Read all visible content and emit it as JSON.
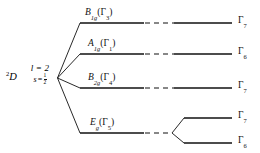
{
  "figure": {
    "type": "energy-level-splitting-diagram",
    "background_color": "#ffffff",
    "line_color": "#111111",
    "width": 260,
    "height": 153
  },
  "term_symbol": {
    "multiplicity": "2",
    "term": "D",
    "quantum_numbers": {
      "orbital_text": "l = 2",
      "spin_symbol": "s",
      "spin_equals": "=",
      "spin_numerator": "1",
      "spin_denominator": "2"
    }
  },
  "levels": [
    {
      "id": "level-b1g",
      "label_main": "B",
      "label_sub": "1g",
      "label_paren_open": "(",
      "label_gamma": "Γ",
      "label_gamma_sub": "3",
      "label_paren_close": ")",
      "right_gamma": "Γ",
      "right_gamma_sub": "7",
      "y": 23
    },
    {
      "id": "level-a1g",
      "label_main": "A",
      "label_sub": "1g",
      "label_paren_open": "(",
      "label_gamma": "Γ",
      "label_gamma_sub": "1",
      "label_paren_close": ")",
      "right_gamma": "Γ",
      "right_gamma_sub": "6",
      "y": 54
    },
    {
      "id": "level-b2g",
      "label_main": "B",
      "label_sub": "2g",
      "label_paren_open": "(",
      "label_gamma": "Γ",
      "label_gamma_sub": "4",
      "label_paren_close": ")",
      "right_gamma": "Γ",
      "right_gamma_sub": "7",
      "y": 88
    },
    {
      "id": "level-eg",
      "label_main": "E",
      "label_sub": "g",
      "label_paren_open": "(",
      "label_gamma": "Γ",
      "label_gamma_sub": "5",
      "label_paren_close": ")",
      "right_gamma": null,
      "right_gamma_sub": null,
      "y": 133
    }
  ],
  "eg_split": [
    {
      "id": "eg-split-upper",
      "right_gamma": "Γ",
      "right_gamma_sub": "7",
      "y": 118
    },
    {
      "id": "eg-split-lower",
      "right_gamma": "Γ",
      "right_gamma_sub": "6",
      "y": 143
    }
  ]
}
